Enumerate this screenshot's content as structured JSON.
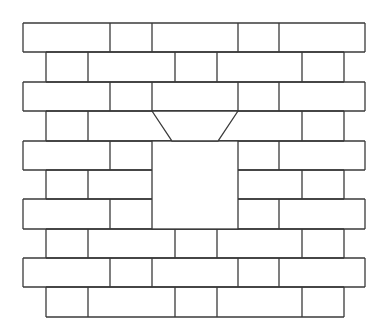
{
  "diagram": {
    "title": "",
    "stroke_color": "#3a3a3a",
    "background": "#ffffff",
    "rows_y": [
      23,
      52,
      82,
      111,
      141,
      170,
      199,
      229,
      258,
      287,
      317
    ],
    "rows": [
      {
        "x0": 23,
        "x1": 365,
        "joints": [
          110,
          152,
          238,
          279
        ]
      },
      {
        "x0": 46,
        "x1": 344,
        "joints": [
          88,
          175,
          217,
          302
        ]
      },
      {
        "x0": 23,
        "x1": 365,
        "joints": [
          110,
          152,
          238,
          279
        ]
      },
      {
        "x0": 46,
        "x1": 344,
        "joints": [
          88,
          302
        ]
      },
      {
        "x0": 23,
        "x1": 365,
        "joints": [
          110,
          279
        ]
      },
      {
        "x0": 46,
        "x1": 344,
        "joints": [
          88,
          302
        ]
      },
      {
        "x0": 23,
        "x1": 365,
        "joints": [
          110,
          279
        ]
      },
      {
        "x0": 46,
        "x1": 344,
        "joints": [
          88,
          175,
          217,
          302
        ]
      },
      {
        "x0": 23,
        "x1": 365,
        "joints": [
          110,
          152,
          238,
          279
        ]
      },
      {
        "x0": 46,
        "x1": 344,
        "joints": [
          88,
          175,
          217,
          302
        ]
      }
    ],
    "window": {
      "x0": 152,
      "x1": 238,
      "y0": 141,
      "y1": 229
    },
    "lintel": {
      "top_x0": 152,
      "top_x1": 238,
      "bottom_x0": 172,
      "bottom_x1": 218,
      "y0": 111,
      "y1": 141
    }
  }
}
